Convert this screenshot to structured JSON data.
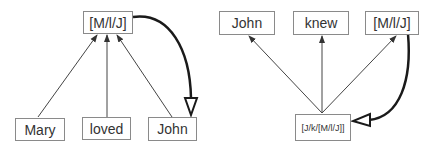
{
  "diagrams": [
    {
      "id": "left",
      "top_node": {
        "label": "[M/l/J]"
      },
      "bottom_nodes": [
        {
          "label": "Mary"
        },
        {
          "label": "loved"
        },
        {
          "label": "John"
        }
      ],
      "thick_arrow": {
        "from": "[M/l/J]",
        "to": "John"
      }
    },
    {
      "id": "right",
      "top_nodes": [
        {
          "label": "John"
        },
        {
          "label": "knew"
        },
        {
          "label": "[M/l/J]"
        }
      ],
      "bottom_node": {
        "label": "[J/k/[M/l/J]]"
      },
      "thick_arrow": {
        "from": "[M/l/J]",
        "to": "[J/k/[M/l/J]]"
      }
    }
  ],
  "colors": {
    "line": "#333333",
    "thick_line": "#1a1a1a",
    "box_border": "#8a8a8a",
    "text": "#333333"
  }
}
